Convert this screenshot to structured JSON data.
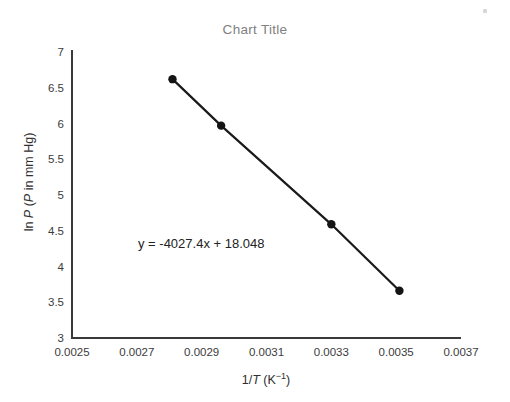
{
  "chart_data": {
    "type": "line",
    "title": "Chart Title",
    "xlabel": "1/T (K⁻¹)",
    "ylabel": "ln P (P in mm Hg)",
    "xlabel_parts": {
      "pre": "1/",
      "italic": "T",
      "post_open": " (K",
      "sup": "−1",
      "post_close": ")"
    },
    "ylabel_parts": {
      "pre": "ln ",
      "italic1": "P",
      "mid": " (",
      "italic2": "P",
      "post": " in mm Hg)"
    },
    "x": [
      0.00281,
      0.00296,
      0.0033,
      0.00351
    ],
    "y": [
      6.62,
      5.97,
      4.59,
      3.66
    ],
    "series": [
      {
        "name": "ln P vs 1/T",
        "points": [
          {
            "x": 0.00281,
            "y": 6.62
          },
          {
            "x": 0.00296,
            "y": 5.97
          },
          {
            "x": 0.0033,
            "y": 4.59
          },
          {
            "x": 0.00351,
            "y": 3.66
          }
        ]
      }
    ],
    "xlim": [
      0.0025,
      0.0037
    ],
    "ylim": [
      3,
      7
    ],
    "xticks": [
      0.0025,
      0.0027,
      0.0029,
      0.0031,
      0.0033,
      0.0035,
      0.0037
    ],
    "xticklabels": [
      "0.0025",
      "0.0027",
      "0.0029",
      "0.0031",
      "0.0033",
      "0.0035",
      "0.0037"
    ],
    "yticks": [
      3,
      3.5,
      4,
      4.5,
      5,
      5.5,
      6,
      6.5,
      7
    ],
    "yticklabels": [
      "3",
      "3.5",
      "4",
      "4.5",
      "5",
      "5.5",
      "6",
      "6.5",
      "7"
    ],
    "grid": false,
    "legend": false,
    "annotations": [
      {
        "name": "trendline-equation",
        "text": "y = -4027.4x + 18.048",
        "slope": -4027.4,
        "intercept": 18.048
      }
    ],
    "colors": {
      "line": "#1a1a1a",
      "marker": "#141414",
      "axis": "#3a3a3a",
      "title": "#808080",
      "tick_label": "#3b3b3b",
      "axis_title": "#2f2f2f",
      "background": "#ffffff"
    }
  }
}
